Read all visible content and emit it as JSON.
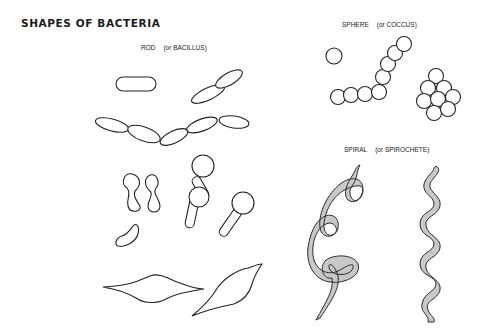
{
  "title": "SHAPES OF BACTERIA",
  "sections": {
    "rod": {
      "name": "ROD",
      "alt": "(or BACILLUS)"
    },
    "sphere": {
      "name": "SPHERE",
      "alt": "(or COCCUS)"
    },
    "spiral": {
      "name": "SPIRAL",
      "alt": "(or SPIROCHETE)"
    }
  },
  "colors": {
    "outline": "#222222",
    "spiral_fill": "#c8c8c8",
    "background": "#ffffff"
  }
}
